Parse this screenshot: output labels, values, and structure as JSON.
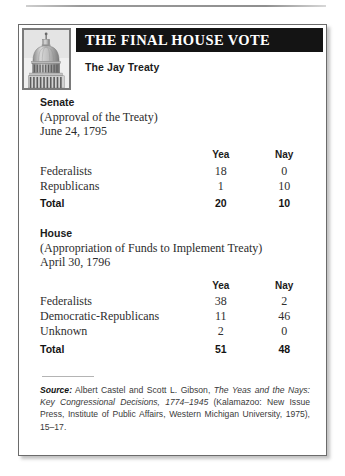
{
  "figure": {
    "title": "THE FINAL HOUSE VOTE",
    "subtitle": "The Jay Treaty",
    "seal_icon": "capitol-dome-icon"
  },
  "columns": {
    "label": "",
    "yea": "Yea",
    "nay": "Nay"
  },
  "senate": {
    "chamber": "Senate",
    "description": "(Approval of the Treaty)",
    "date": "June 24, 1795",
    "rows": [
      {
        "label": "Federalists",
        "yea": "18",
        "nay": "0"
      },
      {
        "label": "Republicans",
        "yea": "1",
        "nay": "10"
      }
    ],
    "total": {
      "label": "Total",
      "yea": "20",
      "nay": "10"
    }
  },
  "house": {
    "chamber": "House",
    "description": "(Appropriation of Funds to Implement Treaty)",
    "date": "April 30, 1796",
    "rows": [
      {
        "label": "Federalists",
        "yea": "38",
        "nay": "2"
      },
      {
        "label": "Democratic-Republicans",
        "yea": "11",
        "nay": "46"
      },
      {
        "label": "Unknown",
        "yea": "2",
        "nay": "0"
      }
    ],
    "total": {
      "label": "Total",
      "yea": "51",
      "nay": "48"
    }
  },
  "source": {
    "label": "Source:",
    "authors": " Albert Castel and Scott L. Gibson, ",
    "title": "The Yeas and the Nays: Key Congressional Decisions, 1774–1945",
    "publication": " (Kalamazoo: New Issue Press, Institute of Public Affairs, Western Michigan University, 1975), 15–17."
  },
  "colors": {
    "title_bar": "#141414",
    "frame_border": "#6b6b6b",
    "text": "#2f2f2f"
  }
}
